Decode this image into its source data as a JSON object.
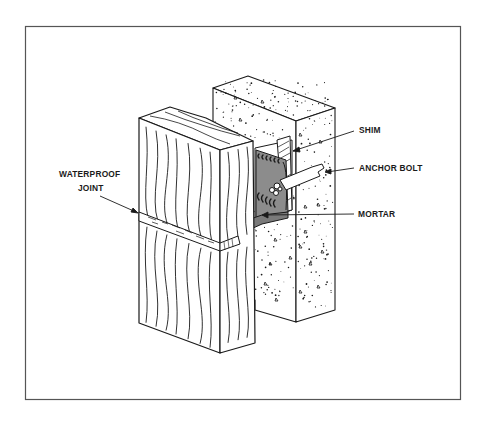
{
  "figure": {
    "type": "isometric cutaway illustration",
    "components": [
      "wood jamb",
      "concrete wall",
      "steel anchor clip",
      "shim",
      "anchor bolt",
      "mortar",
      "waterproof joint"
    ]
  },
  "labels": {
    "shim": "SHIM",
    "anchor_bolt": "ANCHOR BOLT",
    "mortar": "MORTAR",
    "waterproof_line1": "WATERPROOF",
    "waterproof_line2": "JOINT"
  },
  "colors": {
    "ink": "#1a1a1a",
    "frame": "#555555",
    "clip_fill": "#8c8c8c",
    "clip_dark": "#6e6e6e",
    "paper": "#ffffff"
  }
}
